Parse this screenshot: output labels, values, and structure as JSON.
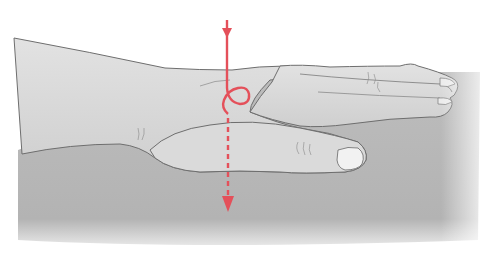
{
  "illustration": {
    "subject": "hand resting flat on table with red path arrow through wrist",
    "colors": {
      "background": "#ffffff",
      "table": "#b5b5b5",
      "skin": "#d8d8d8",
      "outline": "#6e6e6e",
      "arrow": "#e4505a"
    }
  }
}
